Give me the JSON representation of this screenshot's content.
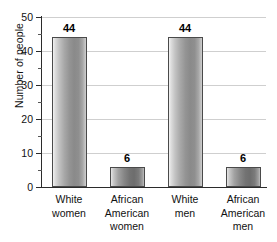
{
  "chart_data": {
    "type": "bar",
    "title": "",
    "xlabel": "",
    "ylabel": "Number of people",
    "ylim": [
      0,
      50
    ],
    "grid": true,
    "legend": "none",
    "y_major_ticks": [
      0,
      10,
      20,
      30,
      40,
      50
    ],
    "y_minor_ticks": [
      5,
      15,
      25,
      35,
      45
    ],
    "y_tick_labels": [
      "0",
      "10",
      "20",
      "30",
      "40",
      "50"
    ],
    "categories": [
      "White women",
      "African American women",
      "White men",
      "African American men"
    ],
    "category_lines": [
      [
        "White",
        "women"
      ],
      [
        "African",
        "American",
        "women"
      ],
      [
        "White",
        "men"
      ],
      [
        "African",
        "American",
        "men"
      ]
    ],
    "values": [
      44,
      6,
      44,
      6
    ],
    "value_labels": [
      "44",
      "6",
      "44",
      "6"
    ],
    "bar_styles": [
      "tall",
      "short",
      "tall",
      "short"
    ],
    "colors": {
      "axis": "#2b2b2b",
      "gridline": "#cfcfcf",
      "bar_light": "#f2f2f2",
      "bar_dark": "#6d6d6d",
      "text": "#111111",
      "background": "#ffffff"
    }
  }
}
